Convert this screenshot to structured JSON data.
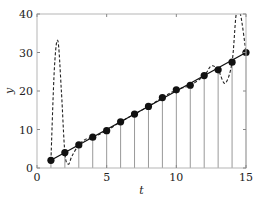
{
  "chart_data": {
    "type": "line",
    "title": "",
    "xlabel": "t",
    "ylabel": "y",
    "xlim": [
      0,
      15
    ],
    "ylim": [
      0,
      40
    ],
    "xticks": [
      0,
      5,
      10,
      15
    ],
    "yticks": [
      0,
      10,
      20,
      30,
      40
    ],
    "grid": false,
    "legend": null,
    "series": [
      {
        "name": "data points",
        "style": "markers with vertical stems",
        "x": [
          1,
          2,
          3,
          4,
          5,
          6,
          7,
          8,
          9,
          10,
          11,
          12,
          13,
          14,
          15
        ],
        "values": [
          2,
          4,
          6,
          8,
          9.7,
          12,
          14,
          16,
          18.3,
          20.3,
          21.5,
          24,
          25.5,
          27.5,
          30
        ]
      },
      {
        "name": "linear fit",
        "style": "solid line",
        "x": [
          1,
          15
        ],
        "values": [
          2,
          30
        ]
      },
      {
        "name": "interpolating polynomial",
        "style": "dashed line",
        "x": [
          1,
          1.25,
          1.5,
          1.75,
          2,
          2.25,
          2.5,
          3,
          3.5,
          4,
          5,
          6,
          7,
          8,
          9,
          10,
          11,
          12,
          12.5,
          13,
          13.5,
          14,
          14.3,
          14.6,
          15
        ],
        "values": [
          2,
          26,
          33,
          20,
          4,
          1,
          3,
          6,
          7.5,
          8,
          9.7,
          12,
          14,
          16,
          18.3,
          20.3,
          21.5,
          24,
          26.5,
          25.5,
          22,
          27.5,
          40,
          40,
          30
        ]
      }
    ]
  },
  "axes": {
    "x_tick_labels": [
      "0",
      "5",
      "10",
      "15"
    ],
    "y_tick_labels": [
      "0",
      "10",
      "20",
      "30",
      "40"
    ],
    "x_title": "t",
    "y_title": "y"
  }
}
